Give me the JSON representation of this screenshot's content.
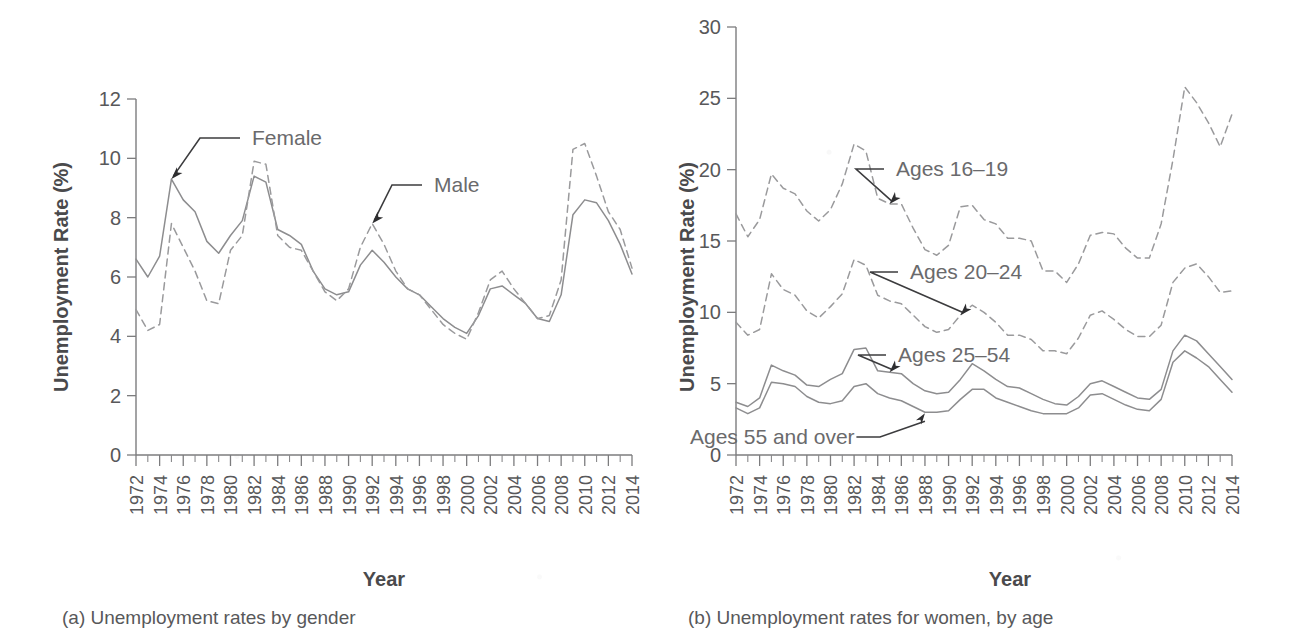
{
  "figure": {
    "panels": [
      {
        "caption": "(a) Unemployment rates by gender",
        "ylabel": "Unemployment Rate (%)",
        "xlabel": "Year"
      },
      {
        "caption": "(b) Unemployment rates for women, by age",
        "ylabel": "Unemployment Rate (%)",
        "xlabel": "Year"
      }
    ],
    "xtick_labels": [
      "1972",
      "1974",
      "1976",
      "1978",
      "1980",
      "1982",
      "1984",
      "1986",
      "1988",
      "1990",
      "1992",
      "1994",
      "1996",
      "1998",
      "2000",
      "2002",
      "2004",
      "2006",
      "2008",
      "2010",
      "2012",
      "2014"
    ],
    "colors": {
      "ink": "#58585a",
      "axis": "#7c7c7e",
      "series_solid": "#8d8d8f",
      "series_dashed": "#9a9a9c",
      "annotation_leader": "#3c3c3e"
    }
  },
  "chart_data": [
    {
      "type": "line",
      "panel": "a",
      "title": "(a) Unemployment rates by gender",
      "xlabel": "Year",
      "ylabel": "Unemployment Rate (%)",
      "xlim": [
        1972,
        2014
      ],
      "ylim": [
        0,
        12
      ],
      "yticks": [
        0,
        2,
        4,
        6,
        8,
        10,
        12
      ],
      "xticks": [
        1972,
        1974,
        1976,
        1978,
        1980,
        1982,
        1984,
        1986,
        1988,
        1990,
        1992,
        1994,
        1996,
        1998,
        2000,
        2002,
        2004,
        2006,
        2008,
        2010,
        2012,
        2014
      ],
      "xtick_rotation": 90,
      "grid": false,
      "legend": "inline-annotations",
      "x": [
        1972,
        1973,
        1974,
        1975,
        1976,
        1977,
        1978,
        1979,
        1980,
        1981,
        1982,
        1983,
        1984,
        1985,
        1986,
        1987,
        1988,
        1989,
        1990,
        1991,
        1992,
        1993,
        1994,
        1995,
        1996,
        1997,
        1998,
        1999,
        2000,
        2001,
        2002,
        2003,
        2004,
        2005,
        2006,
        2007,
        2008,
        2009,
        2010,
        2011,
        2012,
        2013,
        2014
      ],
      "series": [
        {
          "name": "Female",
          "style": "solid",
          "annotation": "Female",
          "annotation_year": 1975,
          "values": [
            6.6,
            6.0,
            6.7,
            9.3,
            8.6,
            8.2,
            7.2,
            6.8,
            7.4,
            7.9,
            9.4,
            9.2,
            7.6,
            7.4,
            7.1,
            6.2,
            5.6,
            5.4,
            5.5,
            6.4,
            6.9,
            6.5,
            6.0,
            5.6,
            5.4,
            5.0,
            4.6,
            4.3,
            4.1,
            4.7,
            5.6,
            5.7,
            5.4,
            5.1,
            4.6,
            4.5,
            5.4,
            8.1,
            8.6,
            8.5,
            7.9,
            7.1,
            6.1
          ]
        },
        {
          "name": "Male",
          "style": "dashed",
          "annotation": "Male",
          "annotation_year": 1992,
          "values": [
            4.9,
            4.2,
            4.4,
            7.8,
            7.0,
            6.2,
            5.2,
            5.1,
            6.9,
            7.4,
            9.9,
            9.8,
            7.4,
            7.0,
            6.9,
            6.2,
            5.5,
            5.2,
            5.6,
            7.0,
            7.8,
            7.1,
            6.2,
            5.6,
            5.4,
            4.9,
            4.4,
            4.1,
            3.9,
            4.8,
            5.9,
            6.2,
            5.6,
            5.1,
            4.6,
            4.7,
            5.9,
            10.3,
            10.5,
            9.4,
            8.2,
            7.6,
            6.3
          ]
        }
      ]
    },
    {
      "type": "line",
      "panel": "b",
      "title": "(b) Unemployment rates for women, by age",
      "xlabel": "Year",
      "ylabel": "Unemployment Rate (%)",
      "xlim": [
        1972,
        2014
      ],
      "ylim": [
        0,
        30
      ],
      "yticks": [
        0,
        5,
        10,
        15,
        20,
        25,
        30
      ],
      "xticks": [
        1972,
        1974,
        1976,
        1978,
        1980,
        1982,
        1984,
        1986,
        1988,
        1990,
        1992,
        1994,
        1996,
        1998,
        2000,
        2002,
        2004,
        2006,
        2008,
        2010,
        2012,
        2014
      ],
      "xtick_rotation": 90,
      "grid": false,
      "legend": "inline-annotations",
      "x": [
        1972,
        1973,
        1974,
        1975,
        1976,
        1977,
        1978,
        1979,
        1980,
        1981,
        1982,
        1983,
        1984,
        1985,
        1986,
        1987,
        1988,
        1989,
        1990,
        1991,
        1992,
        1993,
        1994,
        1995,
        1996,
        1997,
        1998,
        1999,
        2000,
        2001,
        2002,
        2003,
        2004,
        2005,
        2006,
        2007,
        2008,
        2009,
        2010,
        2011,
        2012,
        2013,
        2014
      ],
      "series": [
        {
          "name": "Ages 16-19",
          "style": "dashed",
          "annotation": "Ages 16–19",
          "annotation_year": 1985,
          "values": [
            16.9,
            15.3,
            16.5,
            19.7,
            18.7,
            18.3,
            17.1,
            16.4,
            17.2,
            19.0,
            21.8,
            21.3,
            18.0,
            17.6,
            17.6,
            15.9,
            14.4,
            14.0,
            14.7,
            17.4,
            17.5,
            16.5,
            16.2,
            15.2,
            15.2,
            15.0,
            12.9,
            12.9,
            12.1,
            13.4,
            15.4,
            15.6,
            15.5,
            14.5,
            13.8,
            13.8,
            16.2,
            20.7,
            25.8,
            24.7,
            23.3,
            21.6,
            23.9
          ]
        },
        {
          "name": "Ages 20-24",
          "style": "dashed",
          "annotation": "Ages 20–24",
          "annotation_year": 1991,
          "values": [
            9.3,
            8.4,
            8.8,
            12.7,
            11.6,
            11.2,
            10.1,
            9.6,
            10.4,
            11.3,
            13.7,
            13.3,
            11.2,
            10.8,
            10.6,
            9.8,
            9.0,
            8.6,
            8.8,
            9.8,
            10.5,
            10.0,
            9.3,
            8.4,
            8.4,
            8.1,
            7.3,
            7.3,
            7.1,
            8.2,
            9.8,
            10.1,
            9.5,
            8.8,
            8.3,
            8.3,
            9.1,
            12.1,
            13.1,
            13.4,
            12.5,
            11.4,
            11.5
          ]
        },
        {
          "name": "Ages 25-54",
          "style": "solid",
          "annotation": "Ages 25–54",
          "annotation_year": 1985,
          "values": [
            3.7,
            3.4,
            4.0,
            6.3,
            5.9,
            5.6,
            4.9,
            4.8,
            5.3,
            5.7,
            7.4,
            7.5,
            5.9,
            5.8,
            5.7,
            5.0,
            4.5,
            4.3,
            4.4,
            5.3,
            6.4,
            5.9,
            5.3,
            4.8,
            4.7,
            4.3,
            3.9,
            3.6,
            3.5,
            4.1,
            5.0,
            5.2,
            4.8,
            4.4,
            4.0,
            3.9,
            4.6,
            7.3,
            8.4,
            8.0,
            7.1,
            6.2,
            5.3
          ]
        },
        {
          "name": "Ages 55 and over",
          "style": "solid",
          "annotation": "Ages 55 and over",
          "annotation_year": 1988,
          "values": [
            3.3,
            2.9,
            3.3,
            5.1,
            5.0,
            4.8,
            4.1,
            3.7,
            3.6,
            3.8,
            4.8,
            5.0,
            4.3,
            4.0,
            3.8,
            3.4,
            3.0,
            3.0,
            3.1,
            3.9,
            4.6,
            4.6,
            4.0,
            3.7,
            3.4,
            3.1,
            2.9,
            2.9,
            2.9,
            3.3,
            4.2,
            4.3,
            3.9,
            3.5,
            3.2,
            3.1,
            3.9,
            6.5,
            7.3,
            6.8,
            6.2,
            5.3,
            4.4
          ]
        }
      ]
    }
  ]
}
